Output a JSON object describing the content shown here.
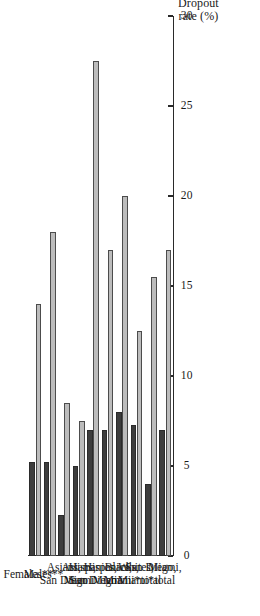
{
  "chart_data": {
    "type": "bar",
    "orientation": "vertical-rotated",
    "title": "",
    "xlabel": "",
    "ylabel": "Dropout\nrate (%)",
    "ylim": [
      0,
      30
    ],
    "yticks": [
      0,
      5,
      10,
      15,
      20,
      25,
      30
    ],
    "ytick_labels": [
      "0",
      "5",
      "10",
      "15",
      "20",
      "25",
      "30"
    ],
    "grid": false,
    "legend": "none",
    "categories": [
      "Miami,\ntotal",
      "San Diego,\ntotal",
      "Whites,\nMiami*",
      "Blacks,\nMiami*",
      "Hispanics,\nMiami",
      "Hispanics,\nSan Diego",
      "Asians,\nMiami",
      "Asians,\nSan Diego",
      "Males**",
      "Females**"
    ],
    "series": [
      {
        "name": "light",
        "color": "#bcbcbc",
        "values": [
          17.0,
          15.5,
          12.5,
          20.0,
          17.0,
          27.5,
          7.5,
          8.5,
          18.0,
          14.0
        ]
      },
      {
        "name": "dark",
        "color": "#3d3d3d",
        "values": [
          7.0,
          4.0,
          7.3,
          8.0,
          7.0,
          7.0,
          5.0,
          2.3,
          5.2,
          5.2
        ]
      }
    ]
  },
  "colors": {
    "light_bar": "#bcbcbc",
    "dark_bar": "#3d3d3d",
    "axis": "#2a2a2a",
    "background": "#ffffff"
  }
}
